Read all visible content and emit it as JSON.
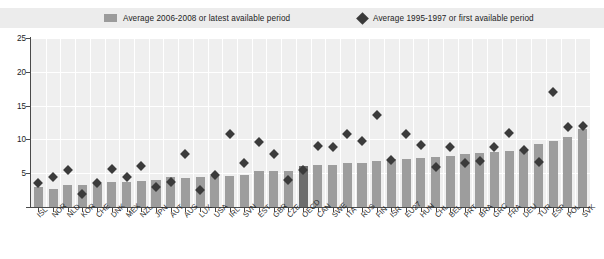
{
  "legend": {
    "series1": {
      "label": "Average 2006-2008 or latest available period",
      "icon": "bar-swatch",
      "color": "#9d9d9d"
    },
    "series2": {
      "label": "Average 1995-1997 or first available period",
      "icon": "diamond-marker",
      "color": "#3b3b3b"
    }
  },
  "axis": {
    "y_ticks": [
      "0",
      "5",
      "10",
      "15",
      "20",
      "25"
    ],
    "ymin": 0,
    "ymax": 25
  },
  "chart_data": {
    "type": "bar",
    "title": "",
    "subtitle": "",
    "xlabel": "",
    "ylabel": "",
    "ylim": [
      0,
      25
    ],
    "grid": true,
    "legend_position": "top",
    "highlight_category": "OECD",
    "highlight_color": "#6d6d6d",
    "categories": [
      "ISL",
      "NOR",
      "NLD",
      "KOR",
      "CHE",
      "DNK",
      "MEX",
      "NZL",
      "JPN",
      "AUT",
      "AUS",
      "LUX",
      "USA",
      "IRL",
      "SVN",
      "EST",
      "GBR",
      "CZE",
      "OECD",
      "CAN",
      "SWE",
      "ITA",
      "RUS",
      "FIN",
      "ISR",
      "EU27",
      "HUN",
      "CHL",
      "BEL",
      "PRT",
      "BRA",
      "GRC",
      "FRA",
      "DEU",
      "TUR",
      "ESP",
      "POL",
      "SVK"
    ],
    "series": [
      {
        "name": "Average 2006-2008 or latest available period",
        "type": "bar",
        "color": "#9d9d9d",
        "values": [
          2.9,
          2.6,
          3.2,
          3.2,
          3.4,
          3.7,
          3.7,
          3.8,
          4.0,
          4.4,
          4.3,
          4.4,
          4.6,
          4.6,
          4.8,
          5.3,
          5.4,
          5.4,
          6.1,
          6.2,
          6.2,
          6.5,
          6.5,
          6.8,
          7.1,
          7.1,
          7.3,
          7.4,
          7.5,
          7.8,
          8.0,
          8.2,
          8.3,
          8.4,
          9.3,
          9.7,
          10.3,
          11.5
        ]
      },
      {
        "name": "Average 1995-1997 or first available period",
        "type": "scatter",
        "marker": "diamond",
        "color": "#3b3b3b",
        "values": [
          4.0,
          5.0,
          6.0,
          2.4,
          4.0,
          6.2,
          5.0,
          6.6,
          3.5,
          4.2,
          8.3,
          3.0,
          5.3,
          11.3,
          7.0,
          10.2,
          8.3,
          4.5,
          6.0,
          9.5,
          9.4,
          11.3,
          10.3,
          14.2,
          7.4,
          11.3,
          9.7,
          6.5,
          9.4,
          7.0,
          7.3,
          9.4,
          11.4,
          9.0,
          7.2,
          17.6,
          12.3,
          12.5
        ]
      }
    ]
  }
}
